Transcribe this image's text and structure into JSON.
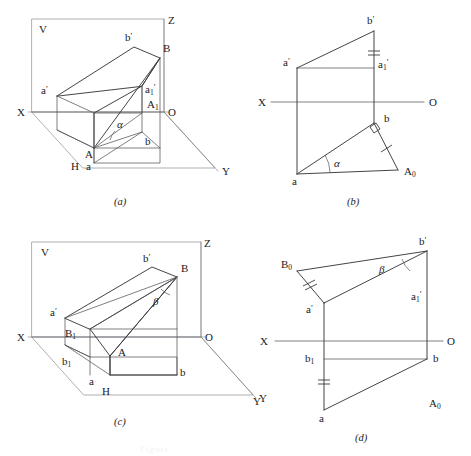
{
  "page": {
    "width": 471,
    "height": 456,
    "background": "#ffffff",
    "line_color": "#55555a",
    "line_color_dark": "#3a3a40",
    "text_color": "#1a1a1a",
    "ghost_header": "",
    "ghost_footer": "Figure"
  },
  "panels": [
    {
      "id": "a",
      "caption": "(a)",
      "kind": "pictorial-projection",
      "labels": {
        "v_plane": "V",
        "h_plane": "H",
        "axis_x": "X",
        "axis_y": "Y",
        "axis_z": "Z",
        "origin": "O",
        "point_A": "A",
        "point_B": "B",
        "point_a_front": "a",
        "point_b_front": "b",
        "point_a_prime": "a",
        "point_a_prime_tick": "′",
        "point_b_prime": "b",
        "point_b_prime_tick": "′",
        "point_a1_prime_base": "a",
        "point_a1_prime_sub": "1",
        "point_a1_prime_tick": "′",
        "point_A1_base": "A",
        "point_A1_sub": "1",
        "angle": "α"
      }
    },
    {
      "id": "b",
      "caption": "(b)",
      "kind": "orthographic-projection",
      "labels": {
        "axis_x": "X",
        "origin": "O",
        "point_a_prime": "a",
        "point_a_prime_tick": "′",
        "point_b_prime": "b",
        "point_b_prime_tick": "′",
        "point_a1_prime_base": "a",
        "point_a1_prime_sub": "1",
        "point_a1_prime_tick": "′",
        "point_a": "a",
        "point_b": "b",
        "point_A0_base": "A",
        "point_A0_sub": "0",
        "angle": "α"
      },
      "markers": {
        "double_tick": "equal-length-double-tick",
        "single_tick": "equal-length-single-tick",
        "right_angle": "right-angle-square"
      }
    },
    {
      "id": "c",
      "caption": "(c)",
      "kind": "pictorial-projection",
      "labels": {
        "v_plane": "V",
        "h_plane": "H",
        "axis_x": "X",
        "axis_y": "Y",
        "axis_z": "Z",
        "origin": "O",
        "point_A": "A",
        "point_B": "B",
        "point_a_front": "a",
        "point_b_front": "b",
        "point_a_prime": "a",
        "point_a_prime_tick": "′",
        "point_b_prime": "b",
        "point_b_prime_tick": "′",
        "point_B1_base": "B",
        "point_B1_sub": "1",
        "point_b1_base": "b",
        "point_b1_sub": "1",
        "angle": "β"
      }
    },
    {
      "id": "d",
      "caption": "(d)",
      "kind": "orthographic-projection",
      "labels": {
        "axis_x": "X",
        "origin": "O",
        "axis_y_stray": "Y",
        "point_a_prime": "a",
        "point_a_prime_tick": "′",
        "point_b_prime": "b",
        "point_b_prime_tick": "′",
        "point_a1_prime_base": "a",
        "point_a1_prime_sub": "1",
        "point_a1_prime_tick": "′",
        "point_a": "a",
        "point_b": "b",
        "point_b1_base": "b",
        "point_b1_sub": "1",
        "point_B0_base": "B",
        "point_B0_sub": "0",
        "point_A0_base": "A",
        "point_A0_sub": "0",
        "angle": "β"
      },
      "markers": {
        "double_tick": "equal-length-double-tick",
        "single_tick": "equal-length-single-tick"
      }
    }
  ]
}
